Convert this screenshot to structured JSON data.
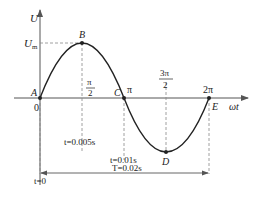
{
  "diagram": {
    "type": "sine-wave",
    "axes": {
      "y_label": "U",
      "x_label": "ωt",
      "origin_label": "0",
      "peak_label": "U",
      "peak_sub": "m"
    },
    "points": [
      {
        "name": "A",
        "phase": "0"
      },
      {
        "name": "B",
        "phase": "π/2"
      },
      {
        "name": "C",
        "phase": "π"
      },
      {
        "name": "D",
        "phase": "3π/2"
      },
      {
        "name": "E",
        "phase": "2π"
      }
    ],
    "ticks": {
      "half_pi_num": "π",
      "half_pi_den": "2",
      "pi": "π",
      "three_half_pi_num": "3π",
      "three_half_pi_den": "2",
      "two_pi": "2π"
    },
    "annotations": {
      "t_quarter": "t=0.005s",
      "t_half": "t=0.01s",
      "period": "T=0.02s",
      "t_zero": "t=0"
    },
    "colors": {
      "line": "#222222",
      "axis": "#555555",
      "dash": "#888888"
    }
  }
}
